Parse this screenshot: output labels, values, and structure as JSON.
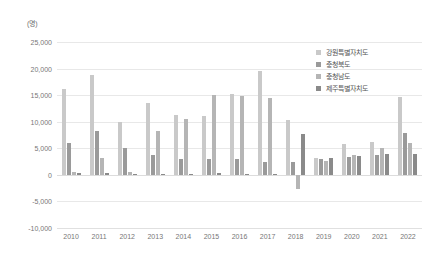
{
  "chart_data": {
    "type": "bar",
    "title": "",
    "subtitle": "",
    "unit_label": "(명)",
    "xlabel": "",
    "ylabel": "",
    "ylim": [
      -10000,
      25000
    ],
    "ytick_values": [
      25000,
      20000,
      15000,
      10000,
      5000,
      0,
      -5000,
      -10000
    ],
    "ytick_labels": [
      "25,000",
      "20,000",
      "15,000",
      "10,000",
      "5,000",
      "0",
      "-5,000",
      "-10,000"
    ],
    "grid": true,
    "legend_position": "top-right",
    "categories": [
      "2010",
      "2011",
      "2012",
      "2013",
      "2014",
      "2015",
      "2016",
      "2017",
      "2018",
      "2019",
      "2020",
      "2021",
      "2022"
    ],
    "series": [
      {
        "name": "강원특별자치도",
        "color": "#c9c9c9",
        "values": [
          16200,
          18700,
          9900,
          13500,
          11300,
          11000,
          15300,
          19500,
          10400,
          3100,
          5800,
          6100,
          14600
        ]
      },
      {
        "name": "충청북도",
        "color": "#9a9a9a",
        "values": [
          6000,
          8300,
          5000,
          3800,
          2900,
          3000,
          3000,
          2500,
          2500,
          2900,
          3400,
          3700,
          7900
        ]
      },
      {
        "name": "충청남도",
        "color": "#b5b5b5",
        "values": [
          600,
          3100,
          600,
          8300,
          10600,
          15100,
          14900,
          14400,
          -2600,
          2600,
          3800,
          5100,
          6000
        ]
      },
      {
        "name": "제주특별자치도",
        "color": "#8a8a8a",
        "values": [
          400,
          300,
          200,
          200,
          200,
          300,
          200,
          200,
          7700,
          3100,
          3500,
          4000,
          3900
        ]
      }
    ]
  },
  "legend": {
    "items": [
      {
        "label": "강원특별자치도"
      },
      {
        "label": "충청북도"
      },
      {
        "label": "충청남도"
      },
      {
        "label": "제주특별자치도"
      }
    ]
  },
  "axis": {
    "unit": "(명)"
  }
}
